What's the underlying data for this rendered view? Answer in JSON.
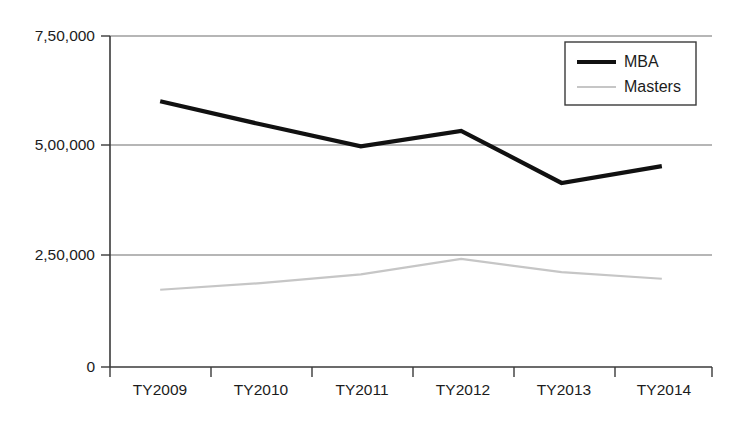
{
  "chart_data": {
    "type": "line",
    "title": "",
    "subtitle": "",
    "xlabel": "",
    "ylabel": "",
    "categories": [
      "TY2009",
      "TY2010",
      "TY2011",
      "TY2012",
      "TY2013",
      "TY2014"
    ],
    "series": [
      {
        "name": "MBA",
        "color": "#111111",
        "values": [
          602000,
          550000,
          500000,
          535000,
          417000,
          455000
        ]
      },
      {
        "name": "Masters",
        "color": "#c6c6c6",
        "values": [
          175000,
          190000,
          210000,
          245000,
          215000,
          200000
        ]
      }
    ],
    "ylim": [
      0,
      750000
    ],
    "yticks": [
      0,
      250000,
      500000,
      750000
    ],
    "ytick_labels": [
      "0",
      "2,50,000",
      "5,00,000",
      "7,50,000"
    ],
    "grid": true,
    "grid_axis": "y",
    "legend_position": "top-right",
    "legend_entries": [
      "MBA",
      "Masters"
    ]
  },
  "caption": {
    "text": ""
  },
  "colors": {
    "background": "#ffffff",
    "axis": "#3a3a3a",
    "grid": "#6e6e6e",
    "text": "#1c1c1c",
    "mba": "#111111",
    "masters": "#c6c6c6"
  }
}
